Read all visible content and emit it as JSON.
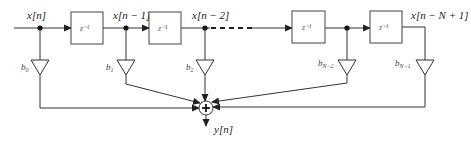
{
  "diagram": {
    "type": "FIR filter direct form block diagram",
    "input_label": "x[n]",
    "output_label": "y[n]",
    "tap_labels": [
      "x[n]",
      "x[n − 1]",
      "x[n − 2]",
      "x[n − N + 1]"
    ],
    "delay_label": "z⁻¹",
    "delays": [
      {
        "label": "z⁻¹"
      },
      {
        "label": "z⁻¹"
      },
      {
        "label": "z⁻¹"
      },
      {
        "label": "z⁻¹"
      }
    ],
    "coefficients": [
      "b₀",
      "b₁",
      "b₂",
      "b_{N−2}",
      "b_{N−1}"
    ],
    "coefficient_display": {
      "b0": {
        "base": "b",
        "sub": "0"
      },
      "b1": {
        "base": "b",
        "sub": "1"
      },
      "b2": {
        "base": "b",
        "sub": "2"
      },
      "bN2": {
        "base": "b",
        "sub": "N−2"
      },
      "bN1": {
        "base": "b",
        "sub": "N−1"
      }
    },
    "adder_symbol": "+",
    "colors": {
      "line": "#333333",
      "box_border": "#444444",
      "background": "#ffffff"
    }
  }
}
